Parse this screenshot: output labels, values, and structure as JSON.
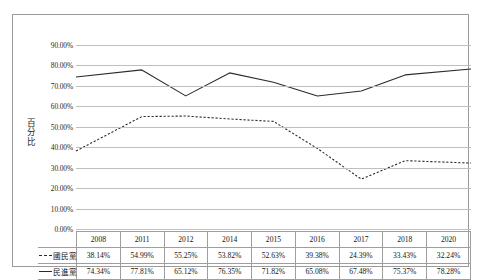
{
  "chart_data": {
    "type": "line",
    "title": "",
    "xlabel": "",
    "ylabel": "百分比",
    "ylim": [
      0,
      0.9
    ],
    "grid": true,
    "legend_position": "table-row-headers",
    "categories": [
      "2008",
      "2011",
      "2012",
      "2014",
      "2015",
      "2016",
      "2017",
      "2018",
      "2020"
    ],
    "ytick_labels": [
      "90.00%",
      "80.00%",
      "70.00%",
      "60.00%",
      "50.00%",
      "40.00%",
      "30.00%",
      "20.00%",
      "10.00%",
      "0.00%"
    ],
    "ytick_values": [
      0.9,
      0.8,
      0.7,
      0.6,
      0.5,
      0.4,
      0.3,
      0.2,
      0.1,
      0.0
    ],
    "series": [
      {
        "name": "國民黨",
        "style": "dashed",
        "color": "#2b2b2b",
        "values": [
          0.3814,
          0.5499,
          0.5525,
          0.5382,
          0.5263,
          0.3938,
          0.2439,
          0.3343,
          0.3224
        ],
        "labels": [
          "38.14%",
          "54.99%",
          "55.25%",
          "53.82%",
          "52.63%",
          "39.38%",
          "24.39%",
          "33.43%",
          "32.24%"
        ]
      },
      {
        "name": "民進黨",
        "style": "solid",
        "color": "#2b2b2b",
        "values": [
          0.7434,
          0.7781,
          0.6512,
          0.7635,
          0.7182,
          0.6508,
          0.6748,
          0.7537,
          0.7828
        ],
        "labels": [
          "74.34%",
          "77.81%",
          "65.12%",
          "76.35%",
          "71.82%",
          "65.08%",
          "67.48%",
          "75.37%",
          "78.28%"
        ]
      }
    ]
  },
  "table": {
    "corner": "",
    "header": [
      "2008",
      "2011",
      "2012",
      "2014",
      "2015",
      "2016",
      "2017",
      "2018",
      "2020"
    ],
    "rows": [
      {
        "label": "國民黨",
        "style": "dashed",
        "cells": [
          "38.14%",
          "54.99%",
          "55.25%",
          "53.82%",
          "52.63%",
          "39.38%",
          "24.39%",
          "33.43%",
          "32.24%"
        ]
      },
      {
        "label": "民進黨",
        "style": "solid",
        "cells": [
          "74.34%",
          "77.81%",
          "65.12%",
          "76.35%",
          "71.82%",
          "65.08%",
          "67.48%",
          "75.37%",
          "78.28%"
        ]
      }
    ]
  },
  "colors": {
    "frame": "#9a9a9a",
    "gridline": "#bfbfbf",
    "line": "#2b2b2b",
    "text": "#1a1a1a",
    "background": "#ffffff"
  }
}
